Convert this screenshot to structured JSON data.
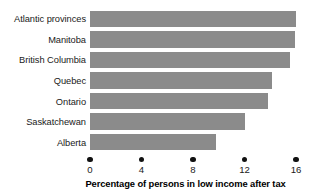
{
  "chart_data": {
    "type": "bar",
    "orientation": "horizontal",
    "title": "",
    "xlabel": "Percentage of persons in low income after tax",
    "ylabel": "",
    "categories": [
      "Atlantic provinces",
      "Manitoba",
      "British Columbia",
      "Quebec",
      "Ontario",
      "Saskatchewan",
      "Alberta"
    ],
    "values": [
      16.0,
      15.9,
      15.5,
      14.1,
      13.8,
      12.0,
      9.8
    ],
    "xticks": [
      0,
      4,
      8,
      12,
      16
    ],
    "xtick_labels": [
      "0",
      "4",
      "8",
      "12",
      "16"
    ],
    "xlim": [
      0,
      16
    ],
    "grid": false,
    "legend": false,
    "bar_color": "#8b8b8b",
    "tick_marker": "filled-circle",
    "background_color": "#ffffff",
    "text_color": "#1a1a1a"
  }
}
